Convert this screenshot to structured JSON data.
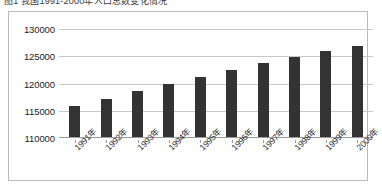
{
  "title": {
    "text": "图1 我国1991-2000年人口总数变化情况"
  },
  "chart": {
    "border_color": "#b9b9b9",
    "plot_background": "#ffffff",
    "gridline_color": "#c8c8c8",
    "bar_color": "#333333"
  },
  "chart_data": {
    "type": "bar",
    "title": "图1 我国1991-2000年人口总数变化情况",
    "xlabel": "",
    "ylabel": "",
    "categories": [
      "1991年",
      "1992年",
      "1993年",
      "1994年",
      "1995年",
      "1996年",
      "1997年",
      "1998年",
      "1999年",
      "2000年"
    ],
    "values": [
      115800,
      117200,
      118600,
      120000,
      121200,
      122500,
      123800,
      124900,
      126000,
      126900
    ],
    "ylim": [
      110000,
      130000
    ],
    "ytick_values": [
      110000,
      115000,
      120000,
      125000,
      130000
    ],
    "ytick_labels": [
      "110000",
      "115000",
      "120000",
      "125000",
      "130000"
    ],
    "grid": true,
    "legend": false,
    "series": [
      {
        "name": "人口总数",
        "values": [
          115800,
          117200,
          118600,
          120000,
          121200,
          122500,
          123800,
          124900,
          126000,
          126900
        ]
      }
    ]
  }
}
